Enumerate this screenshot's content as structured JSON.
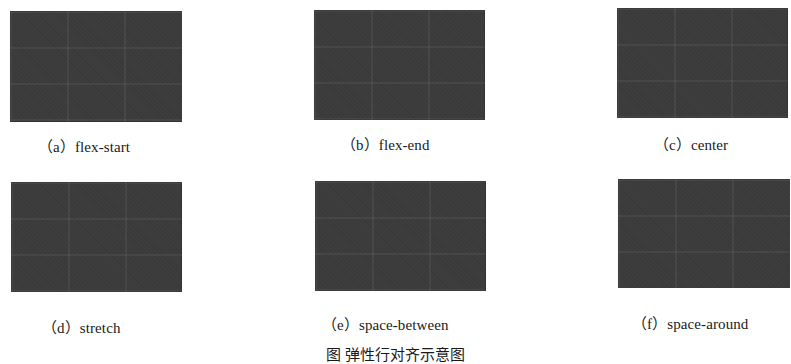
{
  "figure": {
    "background": "#ffffff",
    "box_color": "#3d3d3d",
    "panels": [
      {
        "id": "a",
        "label": "（a）flex-start"
      },
      {
        "id": "b",
        "label": "（b）flex-end"
      },
      {
        "id": "c",
        "label": "（c）center"
      },
      {
        "id": "d",
        "label": "（d）stretch"
      },
      {
        "id": "e",
        "label": "（e）space-between"
      },
      {
        "id": "f",
        "label": "（f）space-around"
      }
    ],
    "caption": "图 弹性行对齐示意图"
  }
}
